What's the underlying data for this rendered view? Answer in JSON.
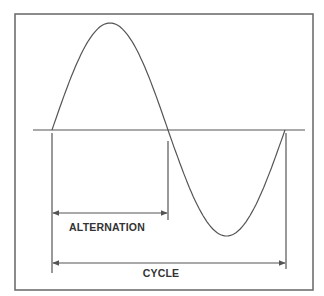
{
  "diagram": {
    "colors": {
      "background": "#ffffff",
      "stroke": "#555555",
      "text": "#333333"
    },
    "frame": {
      "x": 15,
      "y": 14,
      "width": 298,
      "height": 276
    },
    "axis": {
      "x1": 33,
      "x2": 305,
      "y": 130
    },
    "wave": {
      "start_x": 52,
      "mid_x": 168,
      "end_x": 285,
      "baseline_y": 130,
      "peak": {
        "x": 109,
        "y": 23
      },
      "trough": {
        "x": 228,
        "y": 236
      }
    },
    "markers": [
      {
        "name": "cycle-start",
        "x": 52,
        "y1": 133,
        "y2": 273
      },
      {
        "name": "alternation-end",
        "x": 168,
        "y1": 141,
        "y2": 220
      },
      {
        "name": "cycle-end",
        "x": 286,
        "y1": 133,
        "y2": 269
      }
    ],
    "dimensions": [
      {
        "name": "alternation",
        "label": "ALTERNATION",
        "x1": 53,
        "x2": 167,
        "y": 213,
        "label_x": 107,
        "label_y": 227
      },
      {
        "name": "cycle",
        "label": "CYCLE",
        "x1": 53,
        "x2": 285,
        "y": 263,
        "label_x": 161,
        "label_y": 273
      }
    ]
  }
}
